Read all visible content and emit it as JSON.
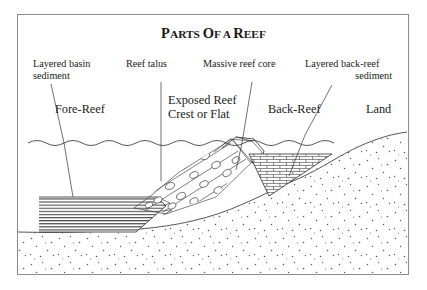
{
  "figure": {
    "title": "Parts of a Reef",
    "border_color": "#8a8a8a",
    "background": "#ffffff",
    "ink_color": "#1a1a1a"
  },
  "labels": {
    "layered_basin_sediment": {
      "line1": "Layered basin",
      "line2": "sediment"
    },
    "reef_talus": "Reef talus",
    "massive_reef_core": "Massive reef core",
    "layered_back_reef_sediment": {
      "line1": "Layered back-reef",
      "line2": "sediment"
    }
  },
  "zones": {
    "fore_reef": "Fore-Reef",
    "exposed_reef_crest": {
      "line1": "Exposed Reef",
      "line2": "Crest or Flat"
    },
    "back_reef": "Back-Reef",
    "land": "Land"
  },
  "patterns": {
    "basin_sediment": "horizontal-layered-hatch",
    "talus": "diagonal-bands-with-clasts",
    "reef_core": "blank-massive",
    "back_reef_sediment": "brick-hatch",
    "basement": "stipple-dots",
    "water_surface": "wavy-line"
  }
}
